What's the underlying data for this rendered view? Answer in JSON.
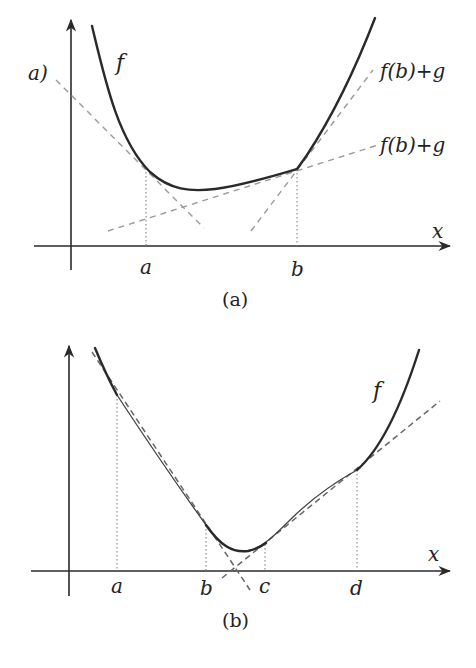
{
  "panel_a": {
    "caption": "(a)",
    "function_label": "f",
    "partial_left_label": "a)",
    "line_label_upper": "f(b)+g",
    "line_label_lower": "f(b)+g",
    "x_axis_label": "x",
    "tick_labels": [
      "a",
      "b"
    ]
  },
  "panel_b": {
    "caption": "(b)",
    "function_label": "f",
    "x_axis_label": "x",
    "tick_labels": [
      "a",
      "b",
      "c",
      "d"
    ]
  },
  "colors": {
    "curve": "#2a2a2a",
    "dashed_line": "#9a9a9a",
    "background": "#ffffff"
  }
}
